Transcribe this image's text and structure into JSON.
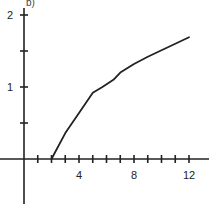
{
  "panel_label": "b)",
  "chart_data": {
    "type": "line",
    "title": "",
    "xlabel": "",
    "ylabel": "",
    "xlim": [
      -1.7,
      13.3
    ],
    "ylim": [
      -0.62,
      2.2
    ],
    "grid": false,
    "legend": null,
    "x_ticks": [
      1,
      2,
      3,
      4,
      5,
      6,
      7,
      8,
      9,
      10,
      11,
      12
    ],
    "x_tick_labels": [
      {
        "value": 4,
        "label": "4"
      },
      {
        "value": 8,
        "label": "8"
      },
      {
        "value": 12,
        "label": "12"
      }
    ],
    "y_ticks": [
      0.5,
      1,
      1.5,
      2
    ],
    "y_tick_labels": [
      {
        "value": 1,
        "label": "1"
      },
      {
        "value": 2,
        "label": "2"
      }
    ],
    "series": [
      {
        "name": "curve",
        "color": "#222222",
        "x": [
          2,
          3,
          4,
          5,
          5.7,
          6.5,
          7,
          8,
          9,
          10,
          11,
          12
        ],
        "y": [
          0,
          0.36,
          0.64,
          0.92,
          1.0,
          1.1,
          1.2,
          1.32,
          1.42,
          1.51,
          1.6,
          1.69
        ]
      }
    ]
  }
}
